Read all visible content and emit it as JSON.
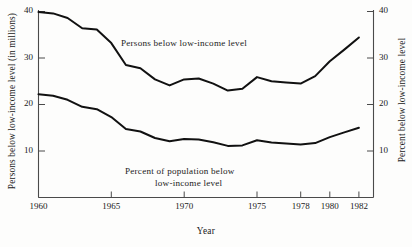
{
  "chart_data": {
    "type": "line",
    "title": "",
    "xlabel": "Year",
    "ylabel": "Persons below low-income level  (in millions)",
    "ylabel_right": "Percent below low-income level",
    "xlim": [
      1960,
      1982
    ],
    "ylim": [
      0,
      40
    ],
    "ylim_right": [
      0,
      40
    ],
    "grid": false,
    "legend": "inline-annotations",
    "xticks": [
      1960,
      1965,
      1970,
      1975,
      1978,
      1980,
      1982
    ],
    "xtick_labels": [
      "1960",
      "1965",
      "1970",
      "1975",
      "1978",
      "1980",
      "1982"
    ],
    "yticks": [
      10,
      20,
      30,
      40
    ],
    "ytick_labels": [
      "10",
      "20",
      "30",
      "40"
    ],
    "yticks_right": [
      10,
      20,
      30,
      40
    ],
    "ytick_labels_right": [
      "10",
      "20",
      "30",
      "40"
    ],
    "x": [
      1960,
      1961,
      1962,
      1963,
      1964,
      1965,
      1966,
      1967,
      1968,
      1969,
      1970,
      1971,
      1972,
      1973,
      1974,
      1975,
      1976,
      1977,
      1978,
      1979,
      1980,
      1981,
      1982
    ],
    "series": [
      {
        "name": "Persons below low-income level",
        "unit": "millions",
        "axis": "left",
        "values": [
          39.9,
          39.6,
          38.6,
          36.4,
          36.1,
          33.2,
          28.5,
          27.8,
          25.4,
          24.1,
          25.4,
          25.6,
          24.5,
          23.0,
          23.4,
          25.9,
          25.0,
          24.7,
          24.5,
          26.1,
          29.3,
          31.8,
          34.4
        ]
      },
      {
        "name": "Percent of population below low-income level",
        "unit": "percent",
        "axis": "right",
        "values": [
          22.2,
          21.9,
          21.0,
          19.5,
          19.0,
          17.3,
          14.7,
          14.2,
          12.8,
          12.1,
          12.6,
          12.5,
          11.9,
          11.1,
          11.2,
          12.3,
          11.8,
          11.6,
          11.4,
          11.7,
          13.0,
          14.0,
          15.0
        ]
      }
    ],
    "annotations": [
      {
        "name": "persons-series-annotation",
        "text": "Persons below low-income level",
        "x": 1966.5,
        "y": 30.5
      },
      {
        "name": "percent-series-annotation-line1",
        "text": "Percent of population below",
        "x": 1967,
        "y": 6.5
      },
      {
        "name": "percent-series-annotation-line2",
        "text": "low-income level",
        "x": 1968.5,
        "y": 4.2
      }
    ],
    "colors": {
      "line": "#111111",
      "axis": "#4a4a4a",
      "background": "#fdfdfc",
      "text": "#1a1a1a"
    }
  }
}
